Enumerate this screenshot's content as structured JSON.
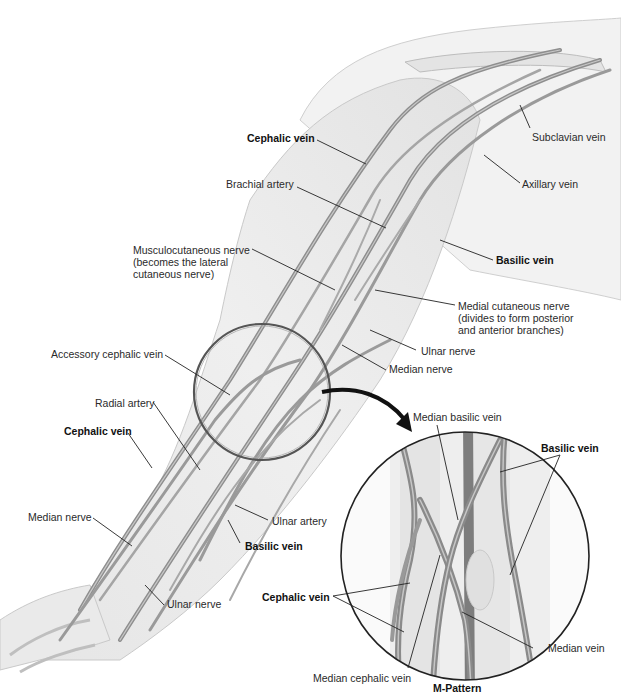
{
  "figure": {
    "inset_title": "M-Pattern",
    "colors": {
      "background": "#ffffff",
      "skin_outline": "#c9c9c9",
      "skin_fill": "#ededed",
      "vein": "#8e8e8e",
      "vein_highlight": "#c4c4c4",
      "leader_line": "#222222",
      "arrow": "#111111",
      "circle": "#333333"
    }
  },
  "labels": {
    "cephalic_vein_upper": "Cephalic vein",
    "brachial_artery": "Brachial artery",
    "subclavian_vein": "Subclavian vein",
    "axillary_vein": "Axillary vein",
    "musculocutaneous_nerve": "Musculocutaneous nerve\n(becomes the lateral\ncutaneous nerve)",
    "basilic_vein_upper": "Basilic vein",
    "medial_cutaneous_nerve": "Medial cutaneous nerve\n(divides to form posterior\nand anterior branches)",
    "ulnar_nerve_upper": "Ulnar nerve",
    "accessory_cephalic_vein": "Accessory cephalic vein",
    "median_nerve_upper": "Median nerve",
    "radial_artery": "Radial artery",
    "cephalic_vein_forearm": "Cephalic vein",
    "median_nerve_forearm": "Median nerve",
    "ulnar_artery": "Ulnar artery",
    "basilic_vein_forearm": "Basilic vein",
    "ulnar_nerve_forearm": "Ulnar nerve"
  },
  "inset_labels": {
    "median_basilic_vein": "Median basilic vein",
    "basilic_vein": "Basilic vein",
    "cephalic_vein": "Cephalic vein",
    "median_vein": "Median vein",
    "median_cephalic_vein": "Median cephalic vein",
    "title": "M-Pattern"
  }
}
